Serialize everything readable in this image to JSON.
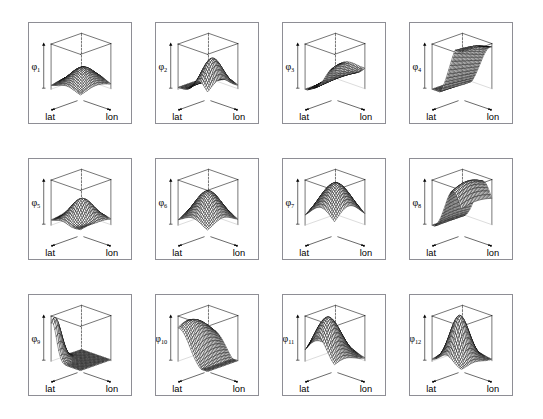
{
  "figure": {
    "type": "grid-of-3d-surface-plots",
    "rows": 3,
    "columns": 4,
    "panel_count": 12,
    "background_color": "#ffffff",
    "frame_color": "#8e8e95",
    "mesh_color": "#000000",
    "axis_color": "#000000"
  },
  "axes_labels": {
    "x": "lat",
    "y": "lon",
    "z_prefix": "φ"
  },
  "chart_data": {
    "type": "line",
    "title": "",
    "xlabel": "lat",
    "ylabel": "lon",
    "zlabel": "φ",
    "grid": false,
    "legend": "none",
    "projection": "3d-perspective-wireframe",
    "mesh_resolution": [
      24,
      24
    ],
    "panels": [
      {
        "index": 1,
        "label": "φ",
        "subscript": "1",
        "name": "phi-1",
        "description": "low broad central mound, flat margins",
        "surface": {
          "kind": "gauss",
          "cx": 0.46,
          "cy": 0.52,
          "sx": 0.3,
          "sy": 0.34,
          "amp": 0.42,
          "base": 0.06,
          "tilt": 0.0,
          "freq": 0,
          "phase": 0
        }
      },
      {
        "index": 2,
        "label": "φ",
        "subscript": "2",
        "name": "phi-2",
        "description": "single peak shifted to left-rear, decaying ridge to right",
        "surface": {
          "kind": "gauss",
          "cx": 0.26,
          "cy": 0.4,
          "sx": 0.2,
          "sy": 0.3,
          "amp": 0.72,
          "base": 0.04,
          "tilt": 0.0,
          "freq": 0,
          "phase": 0
        }
      },
      {
        "index": 3,
        "label": "φ",
        "subscript": "3",
        "name": "phi-3",
        "description": "wave along lat, high ridge at left falling to right",
        "surface": {
          "kind": "wave",
          "cx": 0.2,
          "cy": 0.5,
          "sx": 0.4,
          "sy": 0.6,
          "amp": 0.62,
          "base": 0.12,
          "tilt": -0.38,
          "freq": 1.0,
          "phase": 0.3
        }
      },
      {
        "index": 4,
        "label": "φ",
        "subscript": "4",
        "name": "phi-4",
        "description": "steep ridge along left edge sloping down across the box",
        "surface": {
          "kind": "ramp",
          "cx": 0.1,
          "cy": 0.5,
          "sx": 0.3,
          "sy": 0.8,
          "amp": 0.86,
          "base": 0.05,
          "tilt": -0.7,
          "freq": 0,
          "phase": 0
        }
      },
      {
        "index": 5,
        "label": "φ",
        "subscript": "5",
        "name": "phi-5",
        "description": "oscillating ripple band across the middle",
        "surface": {
          "kind": "wave",
          "cx": 0.5,
          "cy": 0.5,
          "sx": 0.5,
          "sy": 0.26,
          "amp": 0.5,
          "base": 0.1,
          "tilt": 0.0,
          "freq": 1.6,
          "phase": 1.6
        }
      },
      {
        "index": 6,
        "label": "φ",
        "subscript": "6",
        "name": "phi-6",
        "description": "smooth centred dome",
        "surface": {
          "kind": "gauss",
          "cx": 0.5,
          "cy": 0.5,
          "sx": 0.33,
          "sy": 0.33,
          "amp": 0.7,
          "base": 0.05,
          "tilt": 0.0,
          "freq": 0,
          "phase": 0
        }
      },
      {
        "index": 7,
        "label": "φ",
        "subscript": "7",
        "name": "phi-7",
        "description": "broad tall dome filling most of the box",
        "surface": {
          "kind": "gauss",
          "cx": 0.44,
          "cy": 0.46,
          "sx": 0.4,
          "sy": 0.4,
          "amp": 0.9,
          "base": 0.05,
          "tilt": 0.0,
          "freq": 0,
          "phase": 0
        }
      },
      {
        "index": 8,
        "label": "φ",
        "subscript": "8",
        "name": "phi-8",
        "description": "tall ridge rising toward the left-rear",
        "surface": {
          "kind": "ridge",
          "cx": 0.3,
          "cy": 0.48,
          "sx": 0.26,
          "sy": 0.62,
          "amp": 0.92,
          "base": 0.05,
          "tilt": -0.25,
          "freq": 0,
          "phase": 0
        }
      },
      {
        "index": 9,
        "label": "φ",
        "subscript": "9",
        "name": "phi-9",
        "description": "flat plate with sharp spike at the right-rear corner",
        "surface": {
          "kind": "corner",
          "cx": 0.96,
          "cy": 0.08,
          "sx": 0.22,
          "sy": 0.26,
          "amp": 0.95,
          "base": 0.02,
          "tilt": 0.0,
          "freq": 0,
          "phase": 0
        }
      },
      {
        "index": 10,
        "label": "φ",
        "subscript": "10",
        "name": "phi-10",
        "description": "low front shelf rising to a crest at the back right",
        "surface": {
          "kind": "wave",
          "cx": 0.7,
          "cy": 0.3,
          "sx": 0.42,
          "sy": 0.55,
          "amp": 0.7,
          "base": 0.06,
          "tilt": 0.45,
          "freq": 0.8,
          "phase": 2.4
        }
      },
      {
        "index": 11,
        "label": "φ",
        "subscript": "11",
        "name": "phi-11",
        "description": "tall peak near the rear centre, wide skirt",
        "surface": {
          "kind": "gauss",
          "cx": 0.56,
          "cy": 0.32,
          "sx": 0.3,
          "sy": 0.34,
          "amp": 0.96,
          "base": 0.04,
          "tilt": 0.0,
          "freq": 0,
          "phase": 0
        }
      },
      {
        "index": 12,
        "label": "φ",
        "subscript": "12",
        "name": "phi-12",
        "description": "sharp narrow central peak",
        "surface": {
          "kind": "gauss",
          "cx": 0.5,
          "cy": 0.42,
          "sx": 0.22,
          "sy": 0.24,
          "amp": 1.0,
          "base": 0.03,
          "tilt": 0.0,
          "freq": 0,
          "phase": 0
        }
      }
    ]
  }
}
